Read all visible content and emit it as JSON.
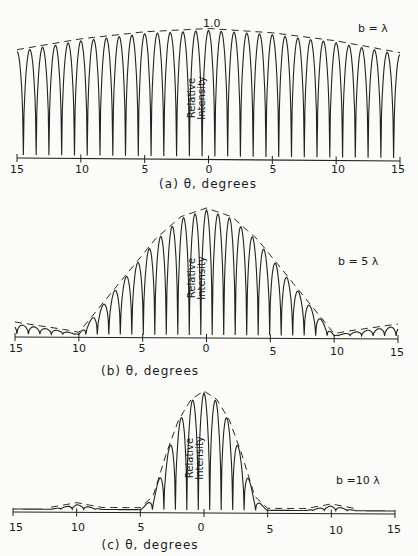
{
  "header": {
    "fragment": "p... y..."
  },
  "chart_data": [
    {
      "type": "line",
      "panel": "(a)",
      "title": "b = λ",
      "xlabel": "θ, degrees",
      "ylabel": "Relative Intensity",
      "peak_label": "1.0",
      "x_ticks": [
        15,
        10,
        5,
        0,
        5,
        10,
        15
      ],
      "xlim": [
        -15,
        15
      ],
      "ylim": [
        0,
        1.0
      ],
      "fringe_spacing_deg": 1.0,
      "envelope": {
        "style": "dashed",
        "x": [
          -15,
          -10,
          -5,
          0,
          5,
          10,
          15
        ],
        "y": [
          0.82,
          0.91,
          0.97,
          1.0,
          0.97,
          0.91,
          0.82
        ]
      }
    },
    {
      "type": "line",
      "panel": "(b)",
      "title": "b = 5 λ",
      "xlabel": "θ, degrees",
      "ylabel": "Relative Intensity",
      "x_ticks": [
        15,
        10,
        5,
        0,
        5,
        10,
        15
      ],
      "xlim": [
        -15,
        15
      ],
      "ylim": [
        0,
        1.0
      ],
      "fringe_spacing_deg": 0.9,
      "envelope": {
        "style": "dashed",
        "x": [
          -15,
          -11,
          -10,
          -8,
          -6,
          -4,
          -2,
          0,
          2,
          4,
          6,
          8,
          10,
          11,
          15
        ],
        "y": [
          0.08,
          0.02,
          0.0,
          0.25,
          0.5,
          0.75,
          0.93,
          1.0,
          0.93,
          0.75,
          0.5,
          0.25,
          0.0,
          0.02,
          0.08
        ]
      }
    },
    {
      "type": "line",
      "panel": "(c)",
      "title": "b =10 λ",
      "xlabel": "θ, degrees",
      "ylabel": "Relative Intensity",
      "x_ticks": [
        15,
        10,
        5,
        0,
        5,
        10,
        15
      ],
      "xlim": [
        -15,
        15
      ],
      "ylim": [
        0,
        1.0
      ],
      "fringe_spacing_deg": 0.9,
      "envelope": {
        "style": "dashed",
        "x": [
          -12,
          -10,
          -8,
          -5,
          -4,
          -3,
          -2,
          -1,
          0,
          1,
          2,
          3,
          4,
          5,
          8,
          10,
          12
        ],
        "y": [
          0.0,
          0.04,
          0.0,
          0.0,
          0.1,
          0.45,
          0.75,
          0.93,
          1.0,
          0.93,
          0.75,
          0.45,
          0.1,
          0.0,
          0.0,
          0.04,
          0.0
        ]
      }
    }
  ],
  "panels": [
    {
      "title": "b = λ",
      "peak": "1.0",
      "ylabel_1": "Relative",
      "ylabel_2": "Intensity",
      "caption": "(a) θ, degrees",
      "ticks": [
        "15",
        "10",
        "5",
        "0",
        "5",
        "10",
        "15"
      ]
    },
    {
      "title": "b = 5 λ",
      "ylabel_1": "Relative",
      "ylabel_2": "Intensity",
      "caption": "(b) θ, degrees",
      "ticks": [
        "15",
        "10",
        "5",
        "0",
        "5",
        "10",
        "15"
      ]
    },
    {
      "title": "b =10 λ",
      "ylabel_1": "Relative",
      "ylabel_2": "Intensity",
      "caption": "(c)  θ, degrees",
      "ticks": [
        "15",
        "10",
        "5",
        "0",
        "5",
        "10",
        "15"
      ]
    }
  ]
}
